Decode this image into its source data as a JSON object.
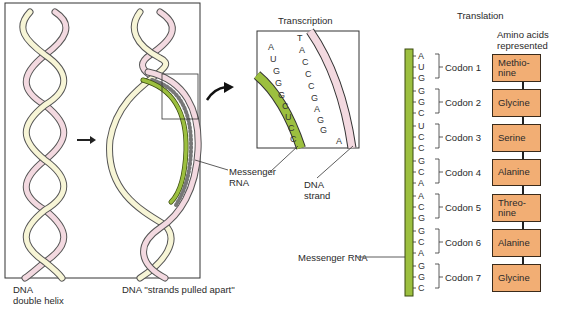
{
  "figure": {
    "left_panel": {
      "label_helix": [
        "DNA",
        "double helix"
      ],
      "label_apart": "DNA ''strands pulled apart''",
      "label_mrna": [
        "Messenger",
        "RNA"
      ]
    },
    "transcription": {
      "title": "Transcription",
      "rna_bases": [
        "A",
        "U",
        "G",
        "G",
        "G",
        "C",
        "U",
        "C",
        "C"
      ],
      "dna_bases": [
        "T",
        "A",
        "C",
        "C",
        "C",
        "G",
        "A",
        "G",
        "G",
        "A"
      ],
      "label_dna_strand": [
        "DNA",
        "strand"
      ]
    },
    "translation": {
      "title": "Translation",
      "amino_header": [
        "Amino acids",
        "represented"
      ],
      "mrna_label": "Messenger RNA",
      "codons": [
        {
          "label": "Codon 1",
          "bases": [
            "A",
            "U",
            "G"
          ],
          "amino": [
            "Methio-",
            "nine"
          ]
        },
        {
          "label": "Codon 2",
          "bases": [
            "G",
            "G",
            "C"
          ],
          "amino": [
            "Glycine"
          ]
        },
        {
          "label": "Codon 3",
          "bases": [
            "U",
            "C",
            "C"
          ],
          "amino": [
            "Serine"
          ]
        },
        {
          "label": "Codon 4",
          "bases": [
            "G",
            "C",
            "A"
          ],
          "amino": [
            "Alanine"
          ]
        },
        {
          "label": "Codon 5",
          "bases": [
            "A",
            "C",
            "G"
          ],
          "amino": [
            "Threo-",
            "nine"
          ]
        },
        {
          "label": "Codon 6",
          "bases": [
            "G",
            "C",
            "A"
          ],
          "amino": [
            "Alanine"
          ]
        },
        {
          "label": "Codon 7",
          "bases": [
            "G",
            "G",
            "C"
          ],
          "amino": [
            "Glycine"
          ]
        }
      ]
    },
    "colors": {
      "mrna_green": "#9cbf3f",
      "dna_pink": "#f3d9e0",
      "dna_cream": "#f7f5d6",
      "amino_orange": "#f2ae74"
    }
  }
}
